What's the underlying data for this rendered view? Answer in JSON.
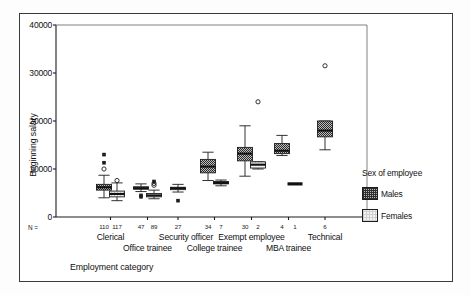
{
  "chart_data": {
    "type": "box",
    "title": "",
    "xlabel": "Employment category",
    "ylabel": "Beginning salary",
    "ylim": [
      0,
      40000
    ],
    "yticks": [
      0,
      10000,
      20000,
      30000,
      40000
    ],
    "ytick_labels": [
      "0",
      "10000",
      "20000",
      "30000",
      "40000"
    ],
    "grid": false,
    "legend_title": "Sex of employee",
    "legend_position": "right",
    "legend_entries": [
      {
        "name": "Males",
        "fill": "dark-hatched",
        "color": "#b9b9b9"
      },
      {
        "name": "Females",
        "fill": "light-stippled",
        "color": "#f2f2f2"
      }
    ],
    "n_label": "N =",
    "categories": [
      "Clerical",
      "Office trainee",
      "Security officer",
      "College trainee",
      "Exempt employee",
      "MBA trainee",
      "Technical"
    ],
    "category_label_rows": [
      {
        "row": 1,
        "labels": [
          "Clerical",
          "Security officer",
          "Exempt employee",
          "Technical"
        ]
      },
      {
        "row": 2,
        "labels": [
          "Office trainee",
          "College trainee",
          "MBA trainee"
        ]
      }
    ],
    "n_values": [
      110,
      117,
      47,
      89,
      27,
      34,
      7,
      30,
      2,
      4,
      1,
      6
    ],
    "boxes": [
      {
        "category": "Clerical",
        "sex": "Males",
        "n": 110,
        "whisker_low": 4000,
        "q1": 5600,
        "median": 6200,
        "q3": 6800,
        "whisker_high": 8700,
        "outliers": [
          10000
        ],
        "extremes": [
          11300,
          13000
        ]
      },
      {
        "category": "Clerical",
        "sex": "Females",
        "n": 117,
        "whisker_low": 3400,
        "q1": 4200,
        "median": 4800,
        "q3": 5400,
        "whisker_high": 7100,
        "outliers": [
          7600
        ],
        "extremes": []
      },
      {
        "category": "Office trainee",
        "sex": "Males",
        "n": 47,
        "whisker_low": 5300,
        "q1": 5800,
        "median": 6000,
        "q3": 6300,
        "whisker_high": 6900,
        "outliers": [],
        "extremes": [
          4200,
          4500
        ]
      },
      {
        "category": "Office trainee",
        "sex": "Females",
        "n": 89,
        "whisker_low": 3800,
        "q1": 4200,
        "median": 4500,
        "q3": 4900,
        "whisker_high": 5600,
        "outliers": [
          6600,
          7000
        ],
        "extremes": [
          7400
        ]
      },
      {
        "category": "Security officer",
        "sex": "Females",
        "n": 27,
        "whisker_low": 5200,
        "q1": 5700,
        "median": 6000,
        "q3": 6200,
        "whisker_high": 6800,
        "outliers": [],
        "extremes": [
          3400
        ]
      },
      {
        "category": "College trainee",
        "sex": "Males",
        "n": 34,
        "whisker_low": 7600,
        "q1": 9200,
        "median": 10500,
        "q3": 12000,
        "whisker_high": 13500,
        "outliers": [],
        "extremes": []
      },
      {
        "category": "College trainee",
        "sex": "Females",
        "n": 7,
        "whisker_low": 6500,
        "q1": 6900,
        "median": 7100,
        "q3": 7400,
        "whisker_high": 7700,
        "outliers": [],
        "extremes": []
      },
      {
        "category": "Exempt employee",
        "sex": "Males",
        "n": 30,
        "whisker_low": 8500,
        "q1": 11700,
        "median": 13200,
        "q3": 14500,
        "whisker_high": 19000,
        "outliers": [],
        "extremes": []
      },
      {
        "category": "Exempt employee",
        "sex": "Females",
        "n": 2,
        "whisker_low": 10000,
        "q1": 10200,
        "median": 10900,
        "q3": 11500,
        "whisker_high": 11500,
        "outliers": [
          24000
        ],
        "extremes": []
      },
      {
        "category": "MBA trainee",
        "sex": "Males",
        "n": 4,
        "whisker_low": 12800,
        "q1": 13200,
        "median": 13800,
        "q3": 15300,
        "whisker_high": 17000,
        "outliers": [],
        "extremes": []
      },
      {
        "category": "MBA trainee",
        "sex": "Females",
        "n": 1,
        "whisker_low": 6900,
        "q1": 6900,
        "median": 6900,
        "q3": 6900,
        "whisker_high": 6900,
        "outliers": [],
        "extremes": []
      },
      {
        "category": "Technical",
        "sex": "Males",
        "n": 6,
        "whisker_low": 14000,
        "q1": 16700,
        "median": 18000,
        "q3": 20000,
        "whisker_high": 20000,
        "outliers": [
          31500
        ],
        "extremes": []
      }
    ]
  }
}
